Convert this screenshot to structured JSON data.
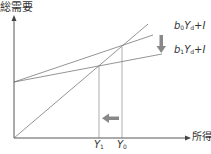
{
  "diagram": {
    "y_axis_label": "総需要",
    "x_axis_label": "所得",
    "ticks": [
      {
        "var": "Y",
        "sub": "1"
      },
      {
        "var": "Y",
        "sub": "0"
      }
    ],
    "lines": [
      {
        "coef": "b",
        "coef_sub": "0",
        "var": "Y",
        "var_sub": "d",
        "rest": "+I"
      },
      {
        "coef": "b",
        "coef_sub": "1",
        "var": "Y",
        "var_sub": "d",
        "rest": "+I"
      }
    ],
    "colors": {
      "line": "#555555",
      "arrow": "#888888",
      "text": "#333333"
    },
    "arrows": [
      {
        "name": "shift-down",
        "meaning": "b0 to b1"
      },
      {
        "name": "shift-left",
        "meaning": "Y0 to Y1"
      }
    ]
  }
}
